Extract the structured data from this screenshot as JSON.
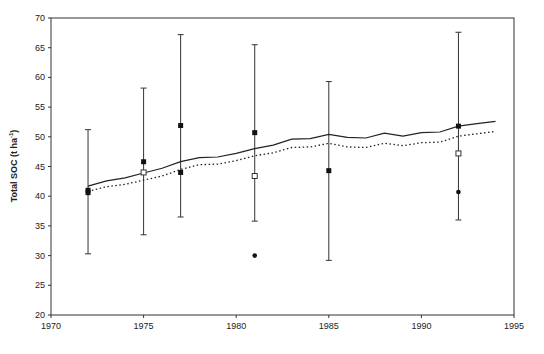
{
  "chart_data": {
    "type": "line",
    "title": "",
    "xlabel": "",
    "ylabel": "Total SOC (t ha",
    "ylabel_superscript": "-1",
    "ylabel_suffix": ")",
    "xlim": [
      1970,
      1995
    ],
    "ylim": [
      20,
      70
    ],
    "x_ticks": [
      1970,
      1975,
      1980,
      1985,
      1990,
      1995
    ],
    "y_ticks": [
      20,
      25,
      30,
      35,
      40,
      45,
      50,
      55,
      60,
      65,
      70
    ],
    "grid": false,
    "legend": null,
    "series": [
      {
        "name": "Model (solid line)",
        "style": "solid",
        "x": [
          1972,
          1973,
          1974,
          1975,
          1976,
          1977,
          1978,
          1979,
          1980,
          1981,
          1982,
          1983,
          1984,
          1985,
          1986,
          1987,
          1988,
          1989,
          1990,
          1991,
          1992,
          1993,
          1994
        ],
        "values": [
          41.7,
          42.6,
          43.1,
          43.9,
          44.7,
          45.8,
          46.5,
          46.6,
          47.2,
          48.0,
          48.6,
          49.6,
          49.7,
          50.4,
          49.9,
          49.8,
          50.6,
          50.1,
          50.7,
          50.8,
          51.8,
          52.2,
          52.6
        ]
      },
      {
        "name": "Model (dotted line)",
        "style": "dotted",
        "x": [
          1972,
          1973,
          1974,
          1975,
          1976,
          1977,
          1978,
          1979,
          1980,
          1981,
          1982,
          1983,
          1984,
          1985,
          1986,
          1987,
          1988,
          1989,
          1990,
          1991,
          1992,
          1993,
          1994
        ],
        "values": [
          40.8,
          41.6,
          42.0,
          42.7,
          43.4,
          44.5,
          45.3,
          45.4,
          46.0,
          46.8,
          47.3,
          48.2,
          48.3,
          48.9,
          48.3,
          48.2,
          48.9,
          48.5,
          49.0,
          49.1,
          50.1,
          50.5,
          50.9
        ]
      },
      {
        "name": "Observed (filled squares) with error bars",
        "marker": "filled-square",
        "x": [
          1972,
          1975,
          1977,
          1981,
          1985,
          1992
        ],
        "values": [
          41.0,
          45.8,
          51.9,
          50.7,
          44.3,
          51.8
        ],
        "error_upper": [
          51.2,
          58.2,
          67.2,
          65.5,
          59.3,
          67.6
        ],
        "error_lower": [
          30.3,
          33.5,
          36.5,
          35.8,
          29.2,
          36.0
        ]
      },
      {
        "name": "Observed (filled squares, second)",
        "marker": "filled-square",
        "x": [
          1972,
          1977
        ],
        "values": [
          40.6,
          44.0
        ]
      },
      {
        "name": "Observed (open squares)",
        "marker": "open-square",
        "x": [
          1975,
          1981,
          1992
        ],
        "values": [
          44.0,
          43.4,
          47.2
        ]
      },
      {
        "name": "Observed (filled circles)",
        "marker": "filled-circle",
        "x": [
          1981,
          1992
        ],
        "values": [
          30.0,
          40.7
        ]
      }
    ]
  }
}
